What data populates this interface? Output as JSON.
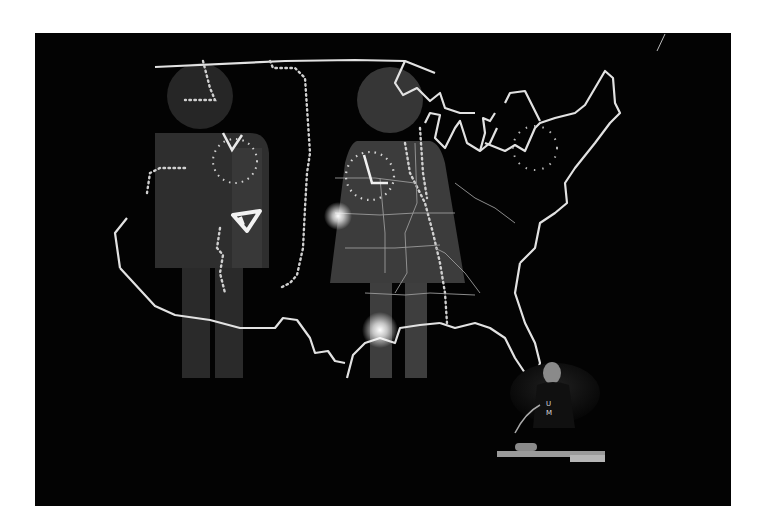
{
  "image": {
    "description": "Black-and-white photograph of a live performance: a projected outline map of the continental United States overlaid with a giant male and female restroom-style pictogram, each with a clock face; a performer at a keyboard with a microphone in the lower right.",
    "frame": {
      "background": "#ffffff",
      "photo_background": "#030303"
    },
    "elements": {
      "map": "United States outline with state borders",
      "figures": [
        "male pictogram",
        "female pictogram"
      ],
      "clocks": [
        "clock on male figure",
        "clock on female figure",
        "dotted clock over Great Lakes / New England"
      ],
      "symbol": "triangle glyph on male figure chest",
      "performer": {
        "shirt_letters": "U M",
        "instrument": "keyboard",
        "has_microphone": true
      }
    },
    "colors": {
      "line": "#e6e6e6",
      "figure_fill": "#3a3a3a",
      "glow": "#ffffff"
    }
  }
}
